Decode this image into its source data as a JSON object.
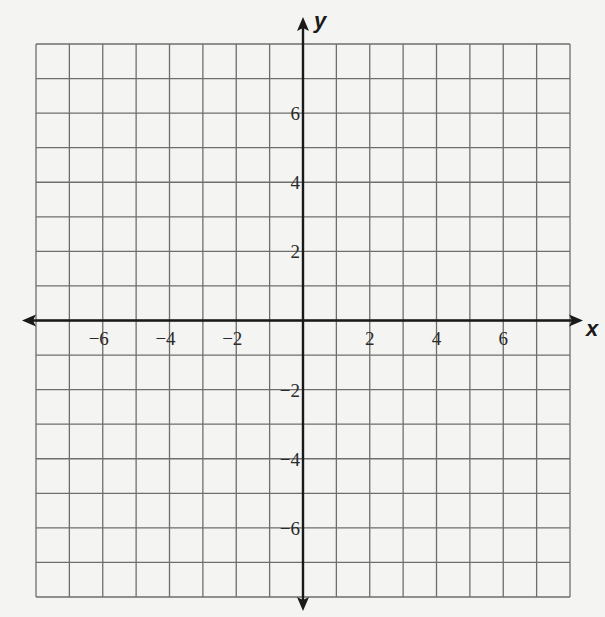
{
  "chart_data": {
    "type": "scatter",
    "title": "",
    "xlabel": "x",
    "ylabel": "y",
    "xlim": [
      -8,
      8
    ],
    "ylim": [
      -8,
      8
    ],
    "grid": true,
    "grid_step": 1,
    "x_ticks": [
      -6,
      -4,
      -2,
      2,
      4,
      6
    ],
    "y_ticks": [
      6,
      4,
      2,
      -2,
      -4,
      -6
    ],
    "x_tick_labels": [
      "−6",
      "−4",
      "−2",
      "2",
      "4",
      "6"
    ],
    "y_tick_labels": [
      "6",
      "4",
      "2",
      "−2",
      "−4",
      "−6"
    ],
    "series": [],
    "legend": null
  },
  "colors": {
    "background": "#f4f4f2",
    "grid": "#6e6e6e",
    "axis": "#1a1a1a"
  }
}
